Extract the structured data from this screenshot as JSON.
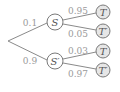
{
  "diagram": {
    "type": "probability-tree",
    "root": {
      "x": 8,
      "y": 41
    },
    "level1": [
      {
        "label": "S",
        "prob": "0.1",
        "x": 55,
        "y": 22,
        "prob_x": 30,
        "prob_y": 23
      },
      {
        "label": "S′",
        "prob": "0.9",
        "x": 55,
        "y": 61,
        "prob_x": 30,
        "prob_y": 61
      }
    ],
    "level2": [
      {
        "parent": "S",
        "label": "T",
        "prob": "0.95",
        "x": 103,
        "y": 12,
        "prob_x": 78,
        "prob_y": 11
      },
      {
        "parent": "S",
        "label": "T′",
        "prob": "0.05",
        "x": 103,
        "y": 31,
        "prob_x": 78,
        "prob_y": 34
      },
      {
        "parent": "S′",
        "label": "T",
        "prob": "0.03",
        "x": 103,
        "y": 51,
        "prob_x": 78,
        "prob_y": 51
      },
      {
        "parent": "S′",
        "label": "T′",
        "prob": "0.97",
        "x": 103,
        "y": 70,
        "prob_x": 78,
        "prob_y": 74
      }
    ]
  }
}
